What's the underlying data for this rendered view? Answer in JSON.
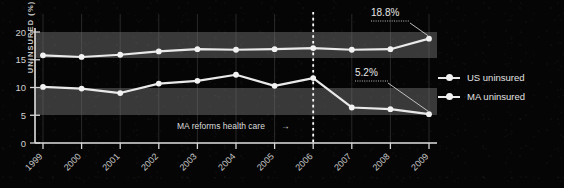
{
  "chart_data": {
    "type": "line",
    "title": "",
    "xlabel": "",
    "ylabel": "UNINSURED (%)",
    "categories": [
      "1999",
      "2000",
      "2001",
      "2002",
      "2003",
      "2004",
      "2005",
      "2006",
      "2007",
      "2008",
      "2009"
    ],
    "xlim": [
      1999,
      2009
    ],
    "ylim": [
      0,
      21
    ],
    "yticks": [
      "0",
      "5",
      "10",
      "15",
      "20"
    ],
    "ytick_values": [
      0,
      5,
      10,
      15,
      20
    ],
    "grid": "vertical-gridlines-and-horizontal-bands",
    "legend_position": "right",
    "series": [
      {
        "name": "US uninsured",
        "values": [
          15.8,
          15.5,
          15.9,
          16.5,
          16.9,
          16.8,
          16.9,
          17.1,
          16.8,
          16.9,
          18.8
        ]
      },
      {
        "name": "MA uninsured",
        "values": [
          10.1,
          9.8,
          9.0,
          10.7,
          11.2,
          12.3,
          10.3,
          11.7,
          6.4,
          6.1,
          5.2
        ]
      }
    ],
    "annotations": [
      {
        "label": "18.8%",
        "series": "US uninsured",
        "year": "2009",
        "value": 18.8
      },
      {
        "label": "5.2%",
        "series": "MA uninsured",
        "year": "2009",
        "value": 5.2
      },
      {
        "label": "MA reforms health care",
        "arrow": "→",
        "year": "2006",
        "marker": "dotted-vertical-line"
      }
    ],
    "colors": {
      "background": "#050505",
      "line": "#e9e9e9",
      "marker": "#f2f2f2",
      "band": "#5a5a5a",
      "axis": "#e0e0e0",
      "text": "#d8d8d8"
    }
  },
  "legend": {
    "items": [
      {
        "label": "US uninsured"
      },
      {
        "label": "MA uninsured"
      }
    ]
  },
  "axis": {
    "ylabel": "UNINSURED (%)"
  }
}
